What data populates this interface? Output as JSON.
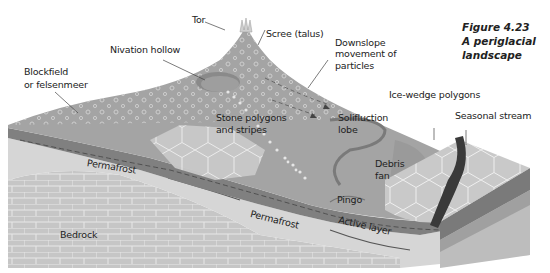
{
  "figure": {
    "number": "Figure 4.23",
    "title_line1": "A periglacial",
    "title_line2": "landscape"
  },
  "labels": {
    "tor": "Tor",
    "scree": "Scree (talus)",
    "nivation_hollow": "Nivation hollow",
    "downslope_1": "Downslope",
    "downslope_2": "movement of",
    "downslope_3": "particles",
    "blockfield_1": "Blockfield",
    "blockfield_2": "or felsenmeer",
    "stone_polygons_1": "Stone polygons",
    "stone_polygons_2": "and stripes",
    "solifluction_1": "Solifluction",
    "solifluction_2": "lobe",
    "ice_wedge": "Ice-wedge polygons",
    "seasonal_stream": "Seasonal stream",
    "debris_fan_1": "Debris",
    "debris_fan_2": "fan",
    "pingo": "Pingo",
    "active_layer": "Active layer",
    "permafrost_upper": "Permafrost",
    "permafrost_lower": "Permafrost",
    "bedrock": "Bedrock"
  },
  "colors": {
    "surface": "#a3a3a3",
    "surface_dark": "#8f8f8f",
    "active_layer": "#7d7d7d",
    "permafrost": "#d4d4d4",
    "bedrock": "#c4c4c4",
    "polygon_fill": "#c8c8c8",
    "stream": "#3a3a3a",
    "text": "#222222"
  }
}
